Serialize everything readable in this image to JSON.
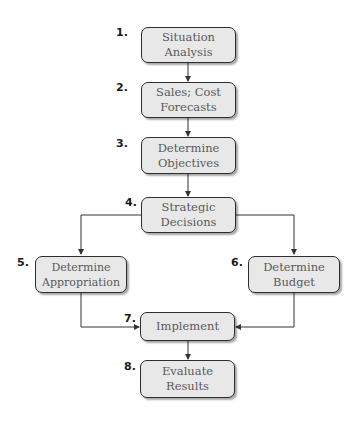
{
  "diagram": {
    "type": "flowchart",
    "steps": [
      {
        "number": "1.",
        "line1": "Situation",
        "line2": "Analysis"
      },
      {
        "number": "2.",
        "line1": "Sales; Cost",
        "line2": "Forecasts"
      },
      {
        "number": "3.",
        "line1": "Determine",
        "line2": "Objectives"
      },
      {
        "number": "4.",
        "line1": "Strategic",
        "line2": "Decisions"
      },
      {
        "number": "5.",
        "line1": "Determine",
        "line2": "Appropriation"
      },
      {
        "number": "6.",
        "line1": "Determine",
        "line2": "Budget"
      },
      {
        "number": "7.",
        "line1": "Implement",
        "line2": ""
      },
      {
        "number": "8.",
        "line1": "Evaluate",
        "line2": "Results"
      }
    ],
    "edges": [
      {
        "from": "1",
        "to": "2"
      },
      {
        "from": "2",
        "to": "3"
      },
      {
        "from": "3",
        "to": "4"
      },
      {
        "from": "4",
        "to": "5"
      },
      {
        "from": "4",
        "to": "6"
      },
      {
        "from": "5",
        "to": "7"
      },
      {
        "from": "6",
        "to": "7"
      },
      {
        "from": "7",
        "to": "8"
      }
    ],
    "colors": {
      "box_fill": "#e8e8e8",
      "box_border": "#2e2e2e",
      "text": "#5a5a5a",
      "connector": "#333333"
    }
  }
}
